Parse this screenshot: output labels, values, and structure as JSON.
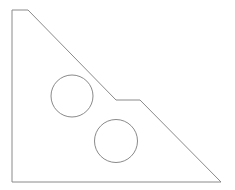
{
  "diagram": {
    "type": "mechanical-part-outline",
    "stroke_color": "#8a8a8a",
    "background": "#ffffff",
    "outline_points": [
      [
        12,
        10
      ],
      [
        28,
        10
      ],
      [
        116,
        100
      ],
      [
        140,
        100
      ],
      [
        221,
        182
      ],
      [
        12,
        182
      ]
    ],
    "holes": [
      {
        "cx": 72,
        "cy": 96,
        "r": 21
      },
      {
        "cx": 116,
        "cy": 141,
        "r": 21.5
      }
    ]
  }
}
